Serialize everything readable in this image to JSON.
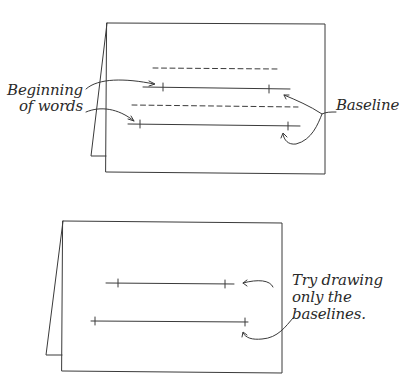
{
  "figure": {
    "top_panel": {
      "labels": {
        "beginning_line1": "Beginning",
        "beginning_line2": "of words",
        "baseline": "Baseline"
      },
      "guide_lines": [
        {
          "type": "dashed",
          "role": "waistline"
        },
        {
          "type": "solid",
          "role": "baseline"
        },
        {
          "type": "dashed",
          "role": "waistline"
        },
        {
          "type": "solid",
          "role": "baseline"
        }
      ]
    },
    "bottom_panel": {
      "labels": {
        "line1": "Try drawing",
        "line2": "only the",
        "line3": "baselines."
      },
      "guide_lines": [
        {
          "type": "solid",
          "role": "baseline"
        },
        {
          "type": "solid",
          "role": "baseline"
        }
      ]
    },
    "colors": {
      "stroke": "#3a3a3a",
      "background": "#ffffff"
    }
  }
}
